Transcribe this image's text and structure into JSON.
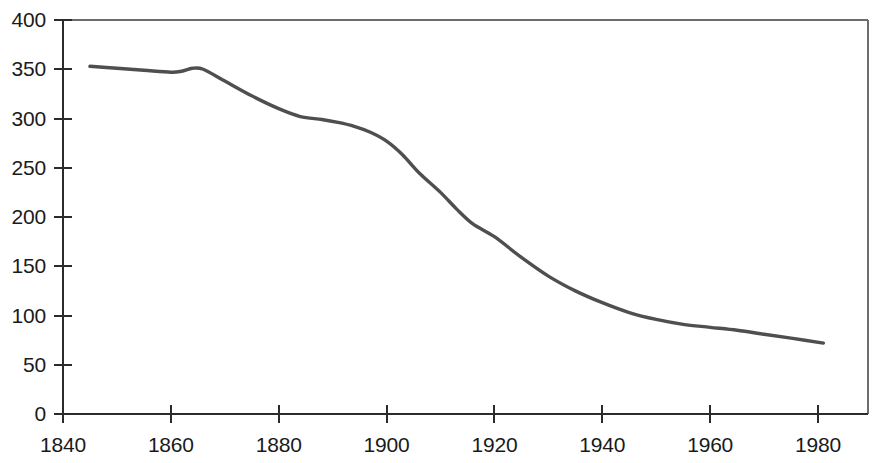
{
  "chart_data": {
    "type": "line",
    "title": "",
    "subtitle": "",
    "xlabel": "",
    "ylabel": "",
    "xlim": [
      1840,
      1986
    ],
    "ylim": [
      0,
      400
    ],
    "grid": false,
    "legend": null,
    "legend_position": "none",
    "line_color": "#4f4f4f",
    "axis_color": "#2b2b2b",
    "frame_color": "#6d6d6d",
    "background": "#ffffff",
    "x_ticks": [
      1840,
      1860,
      1880,
      1900,
      1920,
      1940,
      1960,
      1980
    ],
    "x_tick_labels": [
      "1840",
      "1860",
      "1880",
      "1900",
      "1920",
      "1940",
      "1960",
      "1980"
    ],
    "y_ticks": [
      0,
      50,
      100,
      150,
      200,
      250,
      300,
      350,
      400
    ],
    "y_tick_labels": [
      "0",
      "50",
      "100",
      "150",
      "200",
      "250",
      "300",
      "350",
      "400"
    ],
    "series": [
      {
        "name": "series-1",
        "color": "#4f4f4f",
        "x": [
          1845,
          1850,
          1855,
          1860,
          1862,
          1864,
          1866,
          1870,
          1875,
          1880,
          1884,
          1888,
          1891,
          1894,
          1897,
          1900,
          1903,
          1906,
          1910,
          1913,
          1916,
          1920,
          1925,
          1930,
          1935,
          1940,
          1945,
          1950,
          1955,
          1960,
          1965,
          1970,
          1975,
          1981
        ],
        "y": [
          353,
          351,
          349,
          347,
          348,
          351,
          350,
          338,
          323,
          310,
          302,
          299,
          296,
          292,
          286,
          277,
          263,
          245,
          225,
          208,
          193,
          180,
          159,
          140,
          125,
          113,
          103,
          96,
          91,
          88,
          85,
          81,
          77,
          72
        ]
      }
    ]
  }
}
